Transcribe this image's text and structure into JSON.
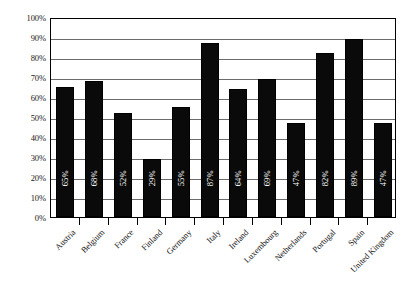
{
  "chart_data": {
    "type": "bar",
    "title": "",
    "subtitle": "",
    "xlabel": "",
    "ylabel": "",
    "ylim": [
      0,
      100
    ],
    "grid": true,
    "legend": false,
    "value_suffix": "%",
    "categories": [
      "Austria",
      "Belgium",
      "France",
      "Finland",
      "Germany",
      "Italy",
      "Ireland",
      "Luxembourg",
      "Netherlands",
      "Portugal",
      "Spain",
      "United Kingdom"
    ],
    "values": [
      65,
      68,
      52,
      29,
      55,
      87,
      64,
      69,
      47,
      82,
      89,
      47
    ],
    "data_labels": [
      "65%",
      "68%",
      "52%",
      "29%",
      "55%",
      "87%",
      "64%",
      "69%",
      "47%",
      "82%",
      "89%",
      "47%"
    ],
    "y_ticks": [
      0,
      10,
      20,
      30,
      40,
      50,
      60,
      70,
      80,
      90,
      100
    ],
    "y_tick_labels": [
      "0%",
      "10%",
      "20%",
      "30%",
      "40%",
      "50%",
      "60%",
      "70%",
      "80%",
      "90%",
      "100%"
    ],
    "colors": {
      "bar_fill": "#0a0a0a",
      "bar_label": "#ffffff",
      "gridline": "#6b6b6b",
      "axis": "#000000",
      "background": "#ffffff",
      "tick_label": "#111111"
    }
  }
}
